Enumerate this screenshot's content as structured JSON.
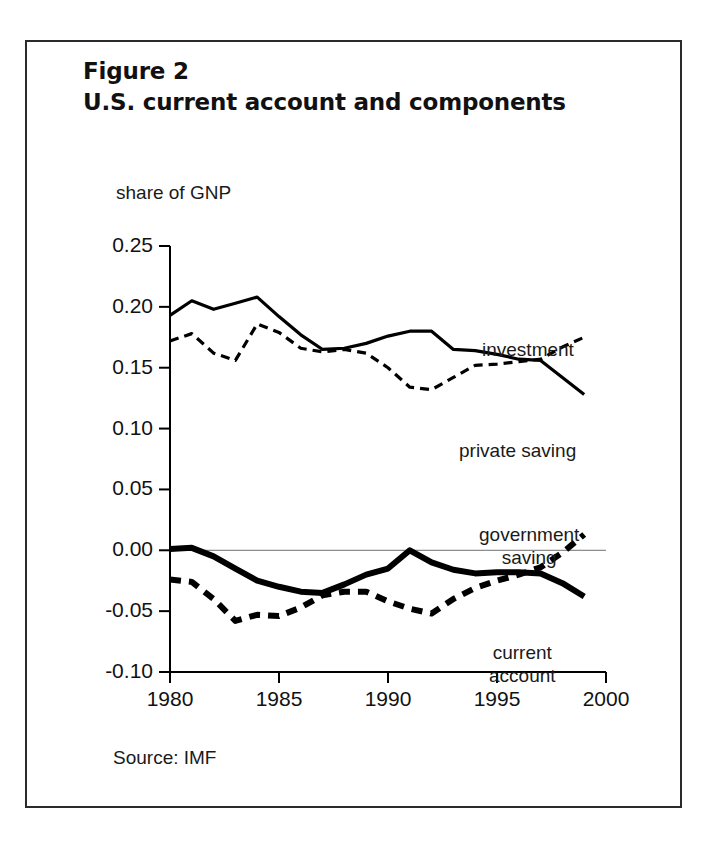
{
  "figure": {
    "title_line1": "Figure 2",
    "title_line2": "U.S. current account and components",
    "source": "Source: IMF",
    "y_unit_label": "share of GNP"
  },
  "labels": {
    "investment": "investment",
    "private_saving": "private saving",
    "government_saving_line1": "government",
    "government_saving_line2": "saving",
    "current_account_line1": "current",
    "current_account_line2": "account"
  },
  "chart_data": {
    "type": "line",
    "title": "U.S. current account and components",
    "subtitle": "Figure 2",
    "xlabel": "",
    "ylabel": "share of GNP",
    "xlim": [
      1980,
      2000
    ],
    "ylim": [
      -0.1,
      0.25
    ],
    "xticks": [
      1980,
      1985,
      1990,
      1995,
      2000
    ],
    "xtick_labels": [
      "1980",
      "1985",
      "1990",
      "1995",
      "2000"
    ],
    "yticks": [
      0.25,
      0.2,
      0.15,
      0.1,
      0.05,
      0.0,
      -0.05,
      -0.1
    ],
    "ytick_labels": [
      "0.25",
      "0.20",
      "0.15",
      "0.10",
      "0.05",
      "0.00",
      "-0.05",
      "-0.10"
    ],
    "grid": false,
    "zero_line": true,
    "legend": "inline-annotations",
    "x": [
      1980,
      1981,
      1982,
      1983,
      1984,
      1985,
      1986,
      1987,
      1988,
      1989,
      1990,
      1991,
      1992,
      1993,
      1994,
      1995,
      1996,
      1997,
      1998,
      1999
    ],
    "series": [
      {
        "name": "private saving",
        "style": "solid-thin",
        "values": [
          0.193,
          0.205,
          0.198,
          0.203,
          0.208,
          0.192,
          0.177,
          0.165,
          0.166,
          0.17,
          0.176,
          0.18,
          0.18,
          0.165,
          0.164,
          0.161,
          0.157,
          0.156,
          0.142,
          0.128
        ]
      },
      {
        "name": "investment",
        "style": "dashed-thin",
        "values": [
          0.172,
          0.178,
          0.162,
          0.156,
          0.186,
          0.179,
          0.166,
          0.163,
          0.165,
          0.162,
          0.15,
          0.134,
          0.132,
          0.142,
          0.152,
          0.153,
          0.155,
          0.157,
          0.167,
          0.175
        ]
      },
      {
        "name": "current account",
        "style": "solid-thick",
        "values": [
          0.001,
          0.002,
          -0.005,
          -0.015,
          -0.025,
          -0.03,
          -0.034,
          -0.035,
          -0.028,
          -0.02,
          -0.015,
          0.0,
          -0.01,
          -0.016,
          -0.019,
          -0.018,
          -0.018,
          -0.019,
          -0.027,
          -0.038
        ]
      },
      {
        "name": "government saving",
        "style": "dashed-thick",
        "values": [
          -0.024,
          -0.026,
          -0.04,
          -0.058,
          -0.053,
          -0.054,
          -0.047,
          -0.037,
          -0.034,
          -0.034,
          -0.042,
          -0.048,
          -0.052,
          -0.04,
          -0.031,
          -0.025,
          -0.02,
          -0.014,
          -0.002,
          0.013
        ]
      }
    ]
  },
  "colors": {
    "ink": "#000000",
    "frame": "#2b2b2b",
    "zero_line": "#707070"
  }
}
